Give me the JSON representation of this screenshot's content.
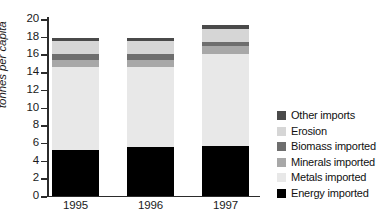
{
  "chart_data": {
    "type": "bar",
    "stacked": true,
    "title": "",
    "xlabel": "",
    "ylabel": "tonnes per capita",
    "categories": [
      "1995",
      "1996",
      "1997"
    ],
    "ylim": [
      0,
      20
    ],
    "yticks": [
      0,
      2,
      4,
      6,
      8,
      10,
      12,
      14,
      16,
      18,
      20
    ],
    "ytick_labels": [
      "0",
      "2",
      "4",
      "6",
      "8",
      "10",
      "12",
      "14",
      "16",
      "18",
      "20"
    ],
    "grid": false,
    "legend_position": "right",
    "series": [
      {
        "name": "Energy imported",
        "color": "#000000",
        "values": [
          5.2,
          5.5,
          5.7
        ]
      },
      {
        "name": "Metals imported",
        "color": "#e8e8e8",
        "values": [
          9.4,
          9.1,
          10.3
        ]
      },
      {
        "name": "Minerals imported",
        "color": "#a8a8a8",
        "values": [
          0.8,
          0.8,
          0.9
        ]
      },
      {
        "name": "Biomass imported",
        "color": "#6e6e6e",
        "values": [
          0.6,
          0.6,
          0.5
        ]
      },
      {
        "name": "Erosion",
        "color": "#d6d6d6",
        "values": [
          1.5,
          1.5,
          1.5
        ]
      },
      {
        "name": "Other imports",
        "color": "#4a4a4a",
        "values": [
          0.4,
          0.4,
          0.4
        ]
      }
    ],
    "totals": [
      17.9,
      17.9,
      19.3
    ],
    "legend_order": [
      "Other imports",
      "Erosion",
      "Biomass imported",
      "Minerals imported",
      "Metals imported",
      "Energy imported"
    ]
  },
  "legend": {
    "items": [
      {
        "label": "Other imports",
        "color": "#4a4a4a",
        "swatch_name": "legend-swatch-other-imports"
      },
      {
        "label": "Erosion",
        "color": "#d6d6d6",
        "swatch_name": "legend-swatch-erosion"
      },
      {
        "label": "Biomass imported",
        "color": "#6e6e6e",
        "swatch_name": "legend-swatch-biomass-imported"
      },
      {
        "label": "Minerals imported",
        "color": "#a8a8a8",
        "swatch_name": "legend-swatch-minerals-imported"
      },
      {
        "label": "Metals imported",
        "color": "#e8e8e8",
        "swatch_name": "legend-swatch-metals-imported"
      },
      {
        "label": "Energy imported",
        "color": "#000000",
        "swatch_name": "legend-swatch-energy-imported"
      }
    ]
  },
  "axes": {
    "y_title": "tonnes per capita",
    "y_tick_labels": [
      "0",
      "2",
      "4",
      "6",
      "8",
      "10",
      "12",
      "14",
      "16",
      "18",
      "20"
    ],
    "x_tick_labels": [
      "1995",
      "1996",
      "1997"
    ]
  }
}
